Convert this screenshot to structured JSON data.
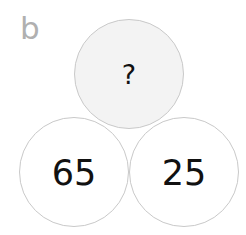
{
  "panel": {
    "label": "b"
  },
  "circles": {
    "top": {
      "value": "?",
      "fill": "#f3f3f3"
    },
    "bottom_left": {
      "value": "65",
      "fill": "#ffffff"
    },
    "bottom_right": {
      "value": "25",
      "fill": "#ffffff"
    }
  },
  "colors": {
    "border": "#c9c9c9",
    "label": "#b0b0b0",
    "text": "#111111"
  }
}
